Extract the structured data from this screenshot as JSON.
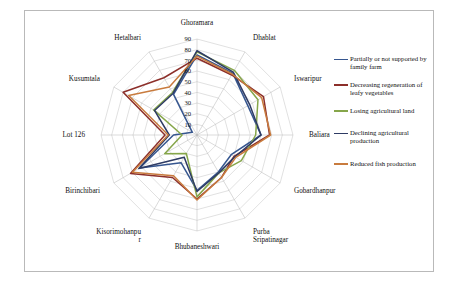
{
  "chart_data": {
    "type": "radar",
    "title": "",
    "xlabel": "",
    "ylabel": "",
    "ylim": [
      0,
      90
    ],
    "tick_step": 10,
    "grid": true,
    "legend_position": "right",
    "categories": [
      "Ghoramara",
      "Dhablat",
      "Iswaripur",
      "Baliara",
      "Gobardhanpur",
      "Purba Sripatinagar",
      "Bhubaneshwari",
      "Kisorimohanpur",
      "Birinchibari",
      "Lot 126",
      "Kusumtala",
      "Hetalbari"
    ],
    "tick_labels": [
      "10",
      "20",
      "30",
      "40",
      "50",
      "60",
      "70",
      "80",
      "90"
    ],
    "series": [
      {
        "name": "Partially or not supported by family farm",
        "color": "#36568f",
        "values": [
          75,
          67,
          55,
          60,
          37,
          40,
          52,
          30,
          62,
          22,
          5,
          44
        ]
      },
      {
        "name": "Decreasing regeneration of leafy vegetables",
        "color": "#8c2f2a",
        "values": [
          72,
          65,
          72,
          68,
          40,
          46,
          60,
          46,
          72,
          30,
          80,
          62
        ]
      },
      {
        "name": "Losing agricultural land",
        "color": "#86a64a",
        "values": [
          78,
          70,
          66,
          55,
          48,
          41,
          58,
          20,
          35,
          14,
          47,
          46
        ]
      },
      {
        "name": "Declining agricultural production",
        "color": "#2e3b64",
        "values": [
          79,
          68,
          57,
          60,
          41,
          41,
          53,
          24,
          63,
          26,
          46,
          45
        ]
      },
      {
        "name": "Reduced fish production",
        "color": "#c87b3e",
        "values": [
          74,
          66,
          70,
          69,
          42,
          46,
          61,
          44,
          70,
          27,
          74,
          52
        ]
      }
    ]
  }
}
